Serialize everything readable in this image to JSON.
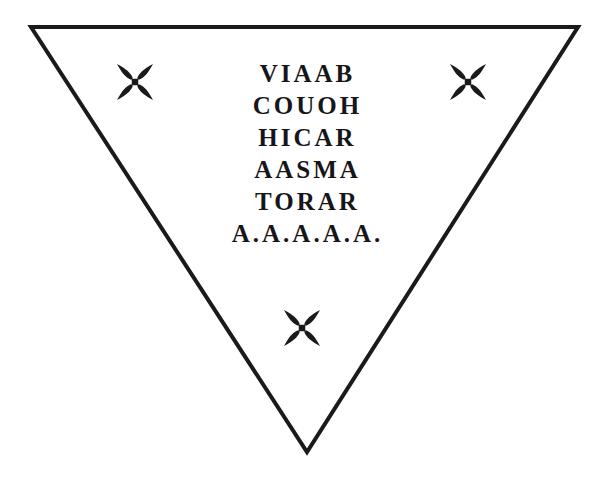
{
  "figure": {
    "name": "inverted-triangle-talisman",
    "shape": "inverted-triangle",
    "background_color": "#ffffff",
    "stroke_color": "#1a1a1a",
    "stroke_width": 4,
    "vertices": {
      "top_left": [
        31,
        27
      ],
      "top_right": [
        578,
        27
      ],
      "bottom_apex": [
        307,
        452
      ]
    }
  },
  "inscription": {
    "text_color": "#16161a",
    "lines": [
      {
        "id": "line-1",
        "text": "VIAAB"
      },
      {
        "id": "line-2",
        "text": "COUOH"
      },
      {
        "id": "line-3",
        "text": "HICAR"
      },
      {
        "id": "line-4",
        "text": "AASMA"
      },
      {
        "id": "line-5",
        "text": "TORAR"
      },
      {
        "id": "line-6",
        "text": "A.A.A.A.A."
      }
    ]
  },
  "crosses": [
    {
      "id": "cross-top-left",
      "icon": "maltese-cross-icon",
      "cx": 135,
      "cy": 82,
      "size": 36,
      "color": "#1a1a1a"
    },
    {
      "id": "cross-top-right",
      "icon": "maltese-cross-icon",
      "cx": 468,
      "cy": 82,
      "size": 36,
      "color": "#1a1a1a"
    },
    {
      "id": "cross-bottom-center",
      "icon": "maltese-cross-icon",
      "cx": 302,
      "cy": 328,
      "size": 36,
      "color": "#1a1a1a"
    }
  ]
}
